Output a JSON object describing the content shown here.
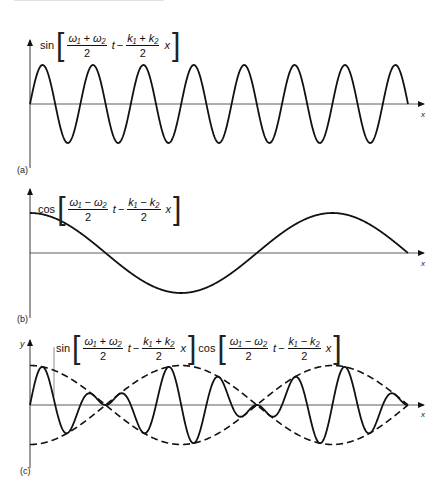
{
  "figure": {
    "panels": [
      {
        "id": "a",
        "label": "(a)",
        "formula": {
          "fn": "sin",
          "term1_num": "ω₁ + ω₂",
          "term1_den": "2",
          "term1_var": "t",
          "op": "−",
          "term2_num": "k₁ + k₂",
          "term2_den": "2",
          "term2_var": "x"
        },
        "x_axis_label": "x"
      },
      {
        "id": "b",
        "label": "(b)",
        "formula": {
          "fn": "cos",
          "term1_num": "ω₁ − ω₂",
          "term1_den": "2",
          "term1_var": "t",
          "op": "−",
          "term2_num": "k₁ − k₂",
          "term2_den": "2",
          "term2_var": "x"
        },
        "x_axis_label": "x"
      },
      {
        "id": "c",
        "label": "(c)",
        "y_axis_label": "y",
        "formula_sin": {
          "fn": "sin",
          "term1_num": "ω₁ + ω₂",
          "term1_den": "2",
          "term1_var": "t",
          "op": "−",
          "term2_num": "k₁ + k₂",
          "term2_den": "2",
          "term2_var": "x"
        },
        "formula_cos": {
          "fn": "cos",
          "term1_num": "ω₁ − ω₂",
          "term1_den": "2",
          "term1_var": "t",
          "op": "−",
          "term2_num": "k₁ − k₂",
          "term2_den": "2",
          "term2_var": "x"
        },
        "x_axis_label": "x"
      }
    ]
  },
  "chart_data": [
    {
      "type": "line",
      "title": "sin[(ω1+ω2)/2 t − (k1+k2)/2 x]",
      "panel": "(a)",
      "xlabel": "x",
      "ylabel": "",
      "series": [
        {
          "name": "carrier",
          "function": "sin",
          "amplitude": 1,
          "cycles_shown": 7.5
        }
      ],
      "grid": false
    },
    {
      "type": "line",
      "title": "cos[(ω1−ω2)/2 t − (k1−k2)/2 x]",
      "panel": "(b)",
      "xlabel": "x",
      "ylabel": "",
      "series": [
        {
          "name": "envelope",
          "function": "cos",
          "amplitude": 1,
          "cycles_shown": 1.25
        }
      ],
      "grid": false
    },
    {
      "type": "line",
      "title": "sin[(ω1+ω2)/2 t − (k1+k2)/2 x] cos[(ω1−ω2)/2 t − (k1−k2)/2 x]",
      "panel": "(c)",
      "xlabel": "x",
      "ylabel": "y",
      "series": [
        {
          "name": "product (beats)",
          "style": "solid"
        },
        {
          "name": "+envelope",
          "style": "dashed"
        },
        {
          "name": "−envelope",
          "style": "dashed"
        }
      ],
      "grid": false
    }
  ]
}
